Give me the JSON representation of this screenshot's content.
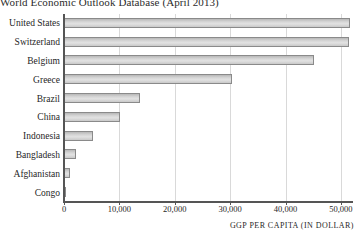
{
  "chart_data": {
    "type": "bar",
    "orientation": "horizontal",
    "title": "World Economic Outlook Database (April 2013)",
    "xlabel": "GGP PER CAPITA (IN DOLLAR)",
    "ylabel": "",
    "xlim": [
      0,
      52000
    ],
    "xticks": [
      0,
      10000,
      20000,
      30000,
      40000,
      50000
    ],
    "xtick_labels": [
      "0",
      "10,000",
      "20,000",
      "30,000",
      "40,000",
      "50,000"
    ],
    "grid": "vertical",
    "legend": null,
    "categories": [
      "United States",
      "Switzerland",
      "Belgium",
      "Greece",
      "Brazil",
      "China",
      "Indonesia",
      "Bangladesh",
      "Afghanistan",
      "Congo"
    ],
    "values": [
      51700,
      51500,
      45200,
      30400,
      13800,
      10200,
      5200,
      2100,
      1000,
      400
    ],
    "bar_color": "#d6d6d6",
    "bar_edge_color": "#8a8a8a",
    "grid_color": "#d9d9d9",
    "axis_color": "#555555",
    "background_color": "#ffffff"
  }
}
